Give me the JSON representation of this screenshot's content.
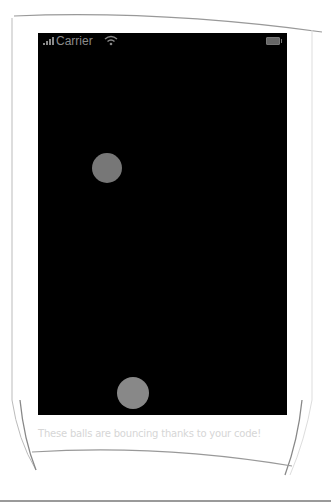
{
  "status_bar": {
    "carrier": "Carrier",
    "signal_icon": "signal-bars-icon",
    "wifi_icon": "wifi-icon",
    "battery_icon": "battery-icon"
  },
  "screen": {
    "background": "#000000",
    "balls": [
      {
        "x": 107,
        "y": 168,
        "radius": 15,
        "color": "#777777"
      },
      {
        "x": 133,
        "y": 393,
        "radius": 16,
        "color": "#888888"
      }
    ]
  },
  "caption": "These balls are bouncing thanks to your code!"
}
